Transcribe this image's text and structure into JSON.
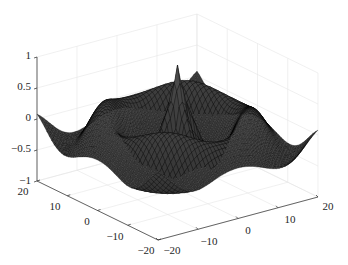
{
  "chart_data": {
    "type": "surface",
    "title": "",
    "xlabel": "",
    "ylabel": "",
    "zlabel": "",
    "x_range": [
      -20,
      20
    ],
    "y_range": [
      -20,
      20
    ],
    "z_range": [
      -1,
      1
    ],
    "x_ticks": [
      -20,
      -10,
      0,
      10,
      20
    ],
    "y_ticks": [
      -20,
      -10,
      0,
      10,
      20
    ],
    "z_ticks": [
      -1,
      -0.5,
      0,
      0.5,
      1
    ],
    "x_tick_labels": [
      "−20",
      "−10",
      "0",
      "10",
      "20"
    ],
    "y_tick_labels": [
      "−20",
      "−10",
      "0",
      "10",
      "20"
    ],
    "z_tick_labels": [
      "−1",
      "−0.5",
      "0",
      "0.5",
      "1"
    ],
    "grid": true,
    "mesh_resolution": 50,
    "peak": {
      "x": 0,
      "y": 0,
      "z": 1
    },
    "surface_color": "#2b2b2b",
    "edge_color": "#000000",
    "grid_color": "#e6e6e6",
    "axis_color": "#262626"
  }
}
